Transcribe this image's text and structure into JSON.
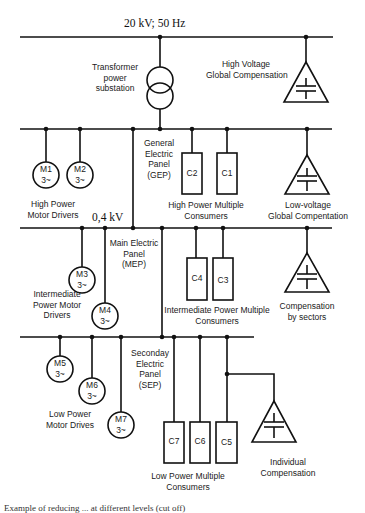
{
  "diagram": {
    "hv_bus_label": "20 kV; 50 Hz",
    "lv_bus_label": "0,4 kV",
    "transformer_label": [
      "Transformer",
      "power",
      "substation"
    ],
    "hv_compensation_label": [
      "High Voltage",
      "Global Compensation"
    ],
    "gep_label": [
      "General",
      "Electric",
      "Panel",
      "(GEP)"
    ],
    "lv_global_compensation_label": [
      "Low-voltage",
      "Global Compentation"
    ],
    "high_power_motors_label": [
      "High Power",
      "Motor Drivers"
    ],
    "high_power_consumers_label": [
      "High Power Multiple",
      "Consumers"
    ],
    "mep_label": [
      "Main Electric",
      "Panel",
      "(MEP)"
    ],
    "intermediate_motors_label": [
      "Intermediate",
      "Power Motor",
      "Drivers"
    ],
    "intermediate_consumers_label": [
      "Intermediate Power Multiple",
      "Consumers"
    ],
    "sector_compensation_label": [
      "Compensation",
      "by sectors"
    ],
    "sep_label": [
      "Seconday",
      "Electric",
      "Panel",
      "(SEP)"
    ],
    "low_power_motors_label": [
      "Low Power",
      "Motor Drives"
    ],
    "low_power_consumers_label": [
      "Low Power Multiple",
      "Consumers"
    ],
    "individual_compensation_label": [
      "Individual",
      "Compensation"
    ],
    "motors": [
      {
        "id": "M1",
        "phase": "3~"
      },
      {
        "id": "M2",
        "phase": "3~"
      },
      {
        "id": "M3",
        "phase": "3~"
      },
      {
        "id": "M4",
        "phase": "3~"
      },
      {
        "id": "M5",
        "phase": "3~"
      },
      {
        "id": "M6",
        "phase": "3~"
      },
      {
        "id": "M7",
        "phase": "3~"
      }
    ],
    "consumers": [
      "C1",
      "C2",
      "C3",
      "C4",
      "C5",
      "C6",
      "C7"
    ],
    "caption": "Example of reducing ... at different levels (cut off)"
  },
  "colors": {
    "line": "#111111",
    "text": "#1a1a1a",
    "background": "#ffffff"
  }
}
